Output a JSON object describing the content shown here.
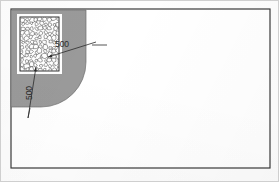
{
  "drawing": {
    "title": "plan-detail-corner",
    "frame": {
      "x": 11,
      "y": 9,
      "width": 259,
      "height": 159,
      "stroke": "#3a3a3a",
      "stroke_width": 1.2,
      "fill": "#ffffff"
    },
    "regions": [
      {
        "name": "paved-apron-region",
        "kind": "filled-region-rounded-corner",
        "fill": "#9a9a9a",
        "stroke": "#6e6e6e",
        "x": 11,
        "y": 10,
        "width": 75,
        "height": 97,
        "corner_radius": 45,
        "corner": "bottom-right"
      }
    ],
    "hatch_box": {
      "name": "rubble-fill-box",
      "kind": "stone-rubble-hatch",
      "x": 17,
      "y": 14,
      "width": 45,
      "height": 60,
      "margin": 3,
      "border_stroke": "#1e1e1e",
      "border_width": 0.9,
      "surround_fill": "#ffffff",
      "stone_stroke": "#2b2b2b",
      "stone_fill": "#ffffff"
    },
    "dimensions": [
      {
        "name": "dimension-horizontal-500",
        "value": "500",
        "orientation": "horizontal",
        "label_x": 62,
        "label_y": 45,
        "leader": {
          "x1": 48,
          "y1": 57,
          "x2": 96,
          "y2": 42
        },
        "arrow_start": {
          "x": 48,
          "y": 57
        },
        "tick": {
          "x": 88,
          "y": 45
        },
        "extension": {
          "x1": 92,
          "y1": 45,
          "x2": 107,
          "y2": 45
        }
      },
      {
        "name": "dimension-vertical-500",
        "value": "500",
        "orientation": "vertical",
        "label_x": 30,
        "label_y": 93,
        "rotation": -90,
        "leader": {
          "x1": 36,
          "y1": 67,
          "x2": 28,
          "y2": 118
        },
        "arrow_start": {
          "x": 36,
          "y": 67
        },
        "tick": {
          "x": 30,
          "y": 104
        },
        "extension": {
          "x1": 30,
          "y1": 108,
          "x2": 28,
          "y2": 118
        }
      }
    ],
    "text_color": "#2a2a2a",
    "label_font_size": 8.5
  }
}
